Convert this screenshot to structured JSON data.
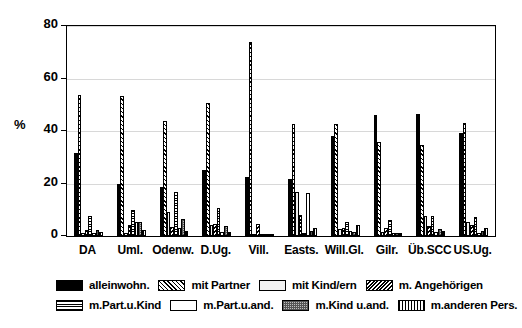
{
  "chart_data": {
    "type": "bar",
    "title": "",
    "xlabel": "",
    "ylabel": "%",
    "ylim": [
      0,
      80
    ],
    "yticks": [
      0,
      20,
      40,
      60,
      80
    ],
    "grid": true,
    "legend_position": "bottom",
    "categories": [
      "DA",
      "Uml.",
      "Odenw.",
      "D.Ug.",
      "Vill.",
      "Easts.",
      "Will.Gl.",
      "Gilr.",
      "Üb.SCC",
      "US.Ug."
    ],
    "series": [
      {
        "name": "alleinwohn.",
        "pattern": "solid-black",
        "values": [
          31.5,
          19.8,
          18.5,
          25.2,
          22.4,
          21.6,
          38.0,
          46.0,
          46.3,
          39.3
        ]
      },
      {
        "name": "mit Partner",
        "pattern": "diagonal-hatch",
        "values": [
          53.6,
          53.2,
          44.0,
          50.7,
          73.8,
          42.5,
          42.8,
          35.9,
          34.6,
          43.2
        ]
      },
      {
        "name": "mit Kind/ern",
        "pattern": "light-gray",
        "values": [
          1.0,
          1.2,
          9.0,
          4.3,
          0.4,
          16.8,
          2.6,
          1.5,
          7.6,
          5.2
        ]
      },
      {
        "name": "m. Angehörigen",
        "pattern": "dense-diagonal",
        "values": [
          2.2,
          4.2,
          3.4,
          4.7,
          4.4,
          8.1,
          3.0,
          3.2,
          4.0,
          4.2
        ]
      },
      {
        "name": "m.Part.u.Kind",
        "pattern": "grid-hatch",
        "values": [
          7.6,
          9.8,
          16.6,
          10.8,
          0.3,
          1.2,
          5.4,
          6.0,
          7.8,
          7.2
        ]
      },
      {
        "name": "m.Part.u.and.",
        "pattern": "white",
        "values": [
          1.1,
          5.4,
          3.0,
          1.4,
          0.2,
          16.2,
          2.0,
          1.3,
          1.6,
          1.0
        ]
      },
      {
        "name": "m.Kind u.and.",
        "pattern": "gray-speckle",
        "values": [
          2.2,
          5.2,
          6.4,
          4.0,
          0.3,
          2.0,
          1.5,
          1.2,
          2.6,
          2.0
        ]
      },
      {
        "name": "m.anderen Pers.",
        "pattern": "vertical-stripe",
        "values": [
          1.6,
          2.2,
          1.8,
          1.6,
          0.2,
          3.2,
          4.2,
          1.0,
          2.0,
          3.0
        ]
      }
    ]
  },
  "axis": {
    "y_title": "%",
    "y_ticks": [
      "0",
      "20",
      "40",
      "60",
      "80"
    ]
  }
}
